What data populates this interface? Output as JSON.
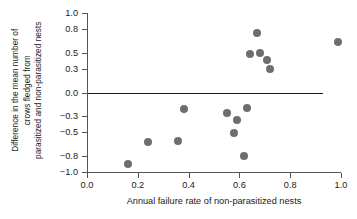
{
  "chart_data": {
    "type": "scatter",
    "title": "",
    "xlabel": "Annual failure rate of non-parasitized nests",
    "ylabel_lines": [
      "Difference in the mean number of",
      "crows fledged from",
      "parasitized and non-parasitized nests"
    ],
    "ylabel": "Difference in the mean number of crows fledged from parasitized and non-parasitized nests",
    "xlim": [
      0.0,
      1.0
    ],
    "ylim": [
      -1.0,
      1.0
    ],
    "xticks": [
      "0.0",
      "0.2",
      "0.4",
      "0.6",
      "0.8",
      "1.0"
    ],
    "xtick_values": [
      0.0,
      0.2,
      0.4,
      0.6,
      0.8,
      1.0
    ],
    "yticks": [
      "1.0",
      "0.8",
      "0.5",
      "0.3",
      "0.0",
      "−0.3",
      "−0.5",
      "−0.8",
      "−1.0"
    ],
    "ytick_values": [
      1.0,
      0.8,
      0.5,
      0.3,
      0.0,
      -0.3,
      -0.5,
      -0.8,
      -1.0
    ],
    "grid": false,
    "legend": null,
    "marker_color": "#6e6e6e",
    "marker_size_px": 8,
    "axis_color": "#555555",
    "text_color": "#1a1a1a",
    "reference_lines": [
      {
        "orientation": "horizontal",
        "y": 0.0,
        "x_start": 0.005,
        "x_end": 0.93,
        "color": "#1a1a1a"
      }
    ],
    "points": [
      {
        "x": 0.16,
        "y": -0.9
      },
      {
        "x": 0.24,
        "y": -0.62
      },
      {
        "x": 0.36,
        "y": -0.61
      },
      {
        "x": 0.38,
        "y": -0.21
      },
      {
        "x": 0.55,
        "y": -0.26
      },
      {
        "x": 0.58,
        "y": -0.51
      },
      {
        "x": 0.59,
        "y": -0.34
      },
      {
        "x": 0.62,
        "y": -0.8
      },
      {
        "x": 0.63,
        "y": -0.19
      },
      {
        "x": 0.64,
        "y": 0.48
      },
      {
        "x": 0.67,
        "y": 0.75
      },
      {
        "x": 0.68,
        "y": 0.5
      },
      {
        "x": 0.71,
        "y": 0.41
      },
      {
        "x": 0.72,
        "y": 0.3
      },
      {
        "x": 0.99,
        "y": 0.63
      }
    ]
  }
}
